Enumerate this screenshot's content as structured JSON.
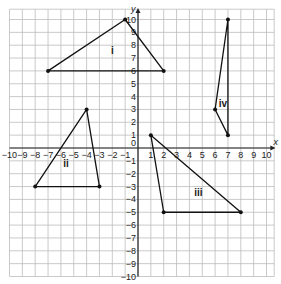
{
  "diagram": {
    "type": "coordinate-grid",
    "x_range": [
      -10,
      10
    ],
    "y_range": [
      -10,
      10
    ],
    "x_axis_label": "x",
    "y_axis_label": "y",
    "origin_label": "0",
    "grid_color": "#bdbdbd",
    "axis_color": "#222222",
    "shape_color": "#111111",
    "shapes": [
      {
        "label": "i",
        "vertices": [
          [
            -7,
            6
          ],
          [
            -1,
            10
          ],
          [
            2,
            6
          ]
        ],
        "label_pos": [
          -2,
          7.3
        ]
      },
      {
        "label": "ii",
        "vertices": [
          [
            -8,
            -3
          ],
          [
            -4,
            3
          ],
          [
            -3,
            -3
          ]
        ],
        "label_pos": [
          -5.6,
          -1.5
        ]
      },
      {
        "label": "iii",
        "vertices": [
          [
            1,
            1
          ],
          [
            2,
            -5
          ],
          [
            8,
            -5
          ]
        ],
        "label_pos": [
          4.7,
          -3.7
        ]
      },
      {
        "label": "iv",
        "vertices": [
          [
            6,
            3
          ],
          [
            7,
            10
          ],
          [
            7,
            1
          ]
        ],
        "label_pos": [
          6.6,
          3.2
        ]
      }
    ]
  }
}
